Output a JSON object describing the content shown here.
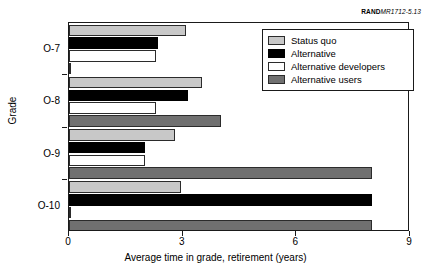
{
  "source_credit": {
    "mark": "RAND",
    "code": "MR1712-5.13"
  },
  "chart_data": {
    "type": "bar",
    "orientation": "horizontal",
    "title": "",
    "xlabel": "Average time in grade, retirement (years)",
    "ylabel": "Grade",
    "categories": [
      "O-7",
      "O-8",
      "O-9",
      "O-10"
    ],
    "xlim": [
      0,
      9
    ],
    "xticks": [
      0,
      3,
      6,
      9
    ],
    "xtick_labels": [
      "0",
      "3",
      "6",
      "9"
    ],
    "grid": false,
    "legend_position": "top-right",
    "series": [
      {
        "name": "Status quo",
        "color": "#c8c8c8",
        "values": [
          3.1,
          3.5,
          2.8,
          2.95
        ]
      },
      {
        "name": "Alternative",
        "color": "#000000",
        "values": [
          2.35,
          3.15,
          2.0,
          8.0
        ]
      },
      {
        "name": "Alternative developers",
        "color": "#ffffff",
        "values": [
          2.3,
          2.3,
          2.0,
          0.05
        ]
      },
      {
        "name": "Alternative users",
        "color": "#707070",
        "values": [
          0.05,
          4.0,
          8.0,
          8.0
        ]
      }
    ]
  },
  "legend": {
    "items": [
      {
        "label": "Status quo"
      },
      {
        "label": "Alternative"
      },
      {
        "label": "Alternative developers"
      },
      {
        "label": "Alternative users"
      }
    ]
  }
}
